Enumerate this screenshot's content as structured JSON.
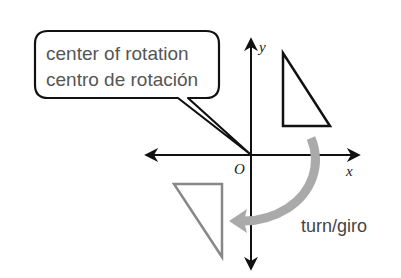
{
  "callout": {
    "line1": "center of rotation",
    "line2": "centro de rotación"
  },
  "axes": {
    "x_label": "x",
    "y_label": "y",
    "origin_label": "O"
  },
  "rotation": {
    "label": "turn/giro",
    "arrow_color": "#aaaaaa"
  },
  "figures": {
    "preimage": {
      "color": "#111111",
      "vertices": [
        [
          283,
          53
        ],
        [
          283,
          126
        ],
        [
          330,
          126
        ]
      ]
    },
    "image": {
      "color": "#888888",
      "vertices": [
        [
          174,
          184
        ],
        [
          222,
          184
        ],
        [
          222,
          257
        ]
      ]
    }
  },
  "colors": {
    "axis": "#111111",
    "callout_border": "#111111",
    "callout_text": "#555555"
  }
}
